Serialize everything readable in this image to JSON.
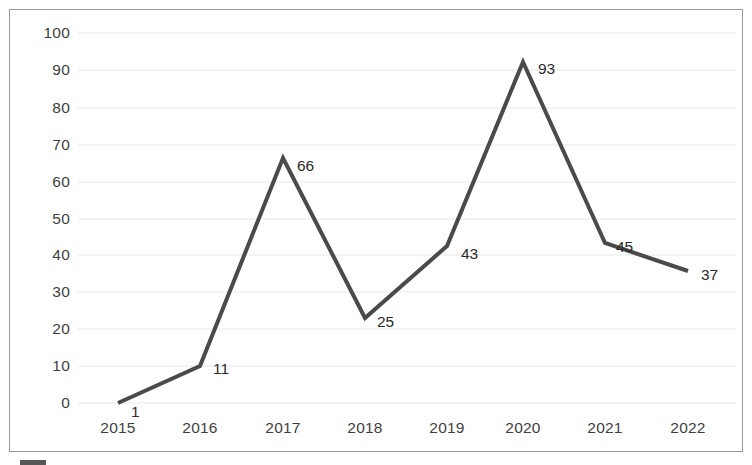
{
  "chart_data": {
    "type": "line",
    "title": "",
    "xlabel": "",
    "ylabel": "",
    "categories": [
      "2015",
      "2016",
      "2017",
      "2018",
      "2019",
      "2020",
      "2021",
      "2022"
    ],
    "values": [
      1,
      11,
      66,
      25,
      43,
      93,
      45,
      37
    ],
    "series": [
      {
        "name": "",
        "values": [
          1,
          11,
          66,
          25,
          43,
          93,
          45,
          37
        ]
      }
    ],
    "ylim": [
      0,
      100
    ],
    "y_ticks": [
      0,
      10,
      20,
      30,
      40,
      50,
      60,
      70,
      80,
      90,
      100
    ],
    "y_tick_labels": [
      "0",
      "10",
      "20",
      "30",
      "40",
      "50",
      "60",
      "70",
      "80",
      "90",
      "100"
    ],
    "x_tick_labels": [
      "2015",
      "2016",
      "2017",
      "2018",
      "2019",
      "2020",
      "2021",
      "2022"
    ],
    "data_labels": [
      "1",
      "11",
      "66",
      "25",
      "43",
      "93",
      "45",
      "37"
    ],
    "grid": "horizontal",
    "legend_position": "bottom",
    "legend_entries": [
      ""
    ],
    "line_color": "#4a4a4a",
    "line_width": 4,
    "grid_color": "#e8e8e8",
    "border_color": "#9a9a9a",
    "background_color": "#ffffff",
    "text_color": "#3f3f3f"
  },
  "geometry": {
    "y_ticks_px": [
      403,
      366,
      329,
      292,
      255,
      219,
      182,
      145,
      108,
      70,
      33
    ],
    "x_ticks_px": [
      118,
      200,
      283,
      365,
      447,
      523,
      605,
      688
    ],
    "points_px": [
      {
        "x": 118,
        "y": 403
      },
      {
        "x": 200,
        "y": 366
      },
      {
        "x": 283,
        "y": 158
      },
      {
        "x": 365,
        "y": 318
      },
      {
        "x": 447,
        "y": 246
      },
      {
        "x": 523,
        "y": 62
      },
      {
        "x": 605,
        "y": 243
      },
      {
        "x": 688,
        "y": 271
      }
    ],
    "label_offsets_px": [
      {
        "x": 131,
        "y": 403
      },
      {
        "x": 213,
        "y": 360
      },
      {
        "x": 297,
        "y": 157
      },
      {
        "x": 377,
        "y": 313
      },
      {
        "x": 461,
        "y": 245
      },
      {
        "x": 538,
        "y": 60
      },
      {
        "x": 616,
        "y": 238
      },
      {
        "x": 701,
        "y": 266
      }
    ]
  },
  "legend": {
    "label": ""
  }
}
